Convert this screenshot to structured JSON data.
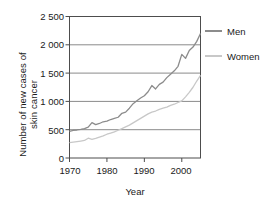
{
  "chart_data": {
    "type": "line",
    "title": "",
    "xlabel": "Year",
    "ylabel": "Number of new cases of\nskin cancer",
    "xlim": [
      1970,
      2005
    ],
    "ylim": [
      0,
      2500
    ],
    "xticks": [
      1970,
      1980,
      1990,
      2000
    ],
    "yticks": [
      0,
      500,
      1000,
      1500,
      2000,
      2500
    ],
    "ytick_labels": [
      "0",
      "500",
      "1 000",
      "1 500",
      "2 000",
      "2 500"
    ],
    "xtick_labels": [
      "1970",
      "1980",
      "1990",
      "2000"
    ],
    "grid": "horizontal",
    "legend_position": "right",
    "x": [
      1970,
      1971,
      1972,
      1973,
      1974,
      1975,
      1976,
      1977,
      1978,
      1979,
      1980,
      1981,
      1982,
      1983,
      1984,
      1985,
      1986,
      1987,
      1988,
      1989,
      1990,
      1991,
      1992,
      1993,
      1994,
      1995,
      1996,
      1997,
      1998,
      1999,
      2000,
      2001,
      2002,
      2003,
      2004,
      2005
    ],
    "series": [
      {
        "name": "Men",
        "color": "#8c8c8c",
        "values": [
          470,
          490,
          495,
          505,
          520,
          545,
          625,
          590,
          610,
          640,
          650,
          680,
          700,
          720,
          790,
          810,
          880,
          960,
          1010,
          1060,
          1100,
          1170,
          1280,
          1220,
          1300,
          1340,
          1420,
          1480,
          1540,
          1620,
          1830,
          1760,
          1900,
          1960,
          2060,
          2200
        ]
      },
      {
        "name": "Women",
        "color": "#c8c8c8",
        "values": [
          270,
          280,
          290,
          300,
          310,
          350,
          330,
          345,
          370,
          390,
          420,
          440,
          460,
          490,
          520,
          550,
          580,
          620,
          660,
          700,
          740,
          780,
          810,
          830,
          860,
          880,
          900,
          930,
          950,
          980,
          1010,
          1080,
          1160,
          1250,
          1360,
          1460
        ]
      }
    ]
  },
  "legend": {
    "items": [
      {
        "label": "Men"
      },
      {
        "label": "Women"
      }
    ]
  },
  "colors": {
    "men": "#8c8c8c",
    "women": "#c8c8c8",
    "axis": "#4d4d4d",
    "grid": "#8a8a8a",
    "background": "#ffffff"
  }
}
